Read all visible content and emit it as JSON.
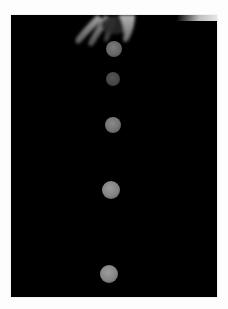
{
  "image": {
    "description": "Stroboscopic photograph of a ball falling after being released from a hand, showing successive positions against a black background",
    "background_color": "#000000",
    "border_color": "#fdfdfd"
  },
  "hand": {
    "position": "top-center",
    "color": "#9a9a9a"
  },
  "balls": [
    {
      "index": 1,
      "cx": 114,
      "cy": 49,
      "r": 8,
      "color": "#6e6e6e"
    },
    {
      "index": 2,
      "cx": 113,
      "cy": 79,
      "r": 7,
      "color": "#4a4a4a"
    },
    {
      "index": 3,
      "cx": 113,
      "cy": 125,
      "r": 8,
      "color": "#7a7a7a"
    },
    {
      "index": 4,
      "cx": 111,
      "cy": 190,
      "r": 9,
      "color": "#8a8a8a"
    },
    {
      "index": 5,
      "cx": 109,
      "cy": 274,
      "r": 9,
      "color": "#8c8c8c"
    }
  ]
}
